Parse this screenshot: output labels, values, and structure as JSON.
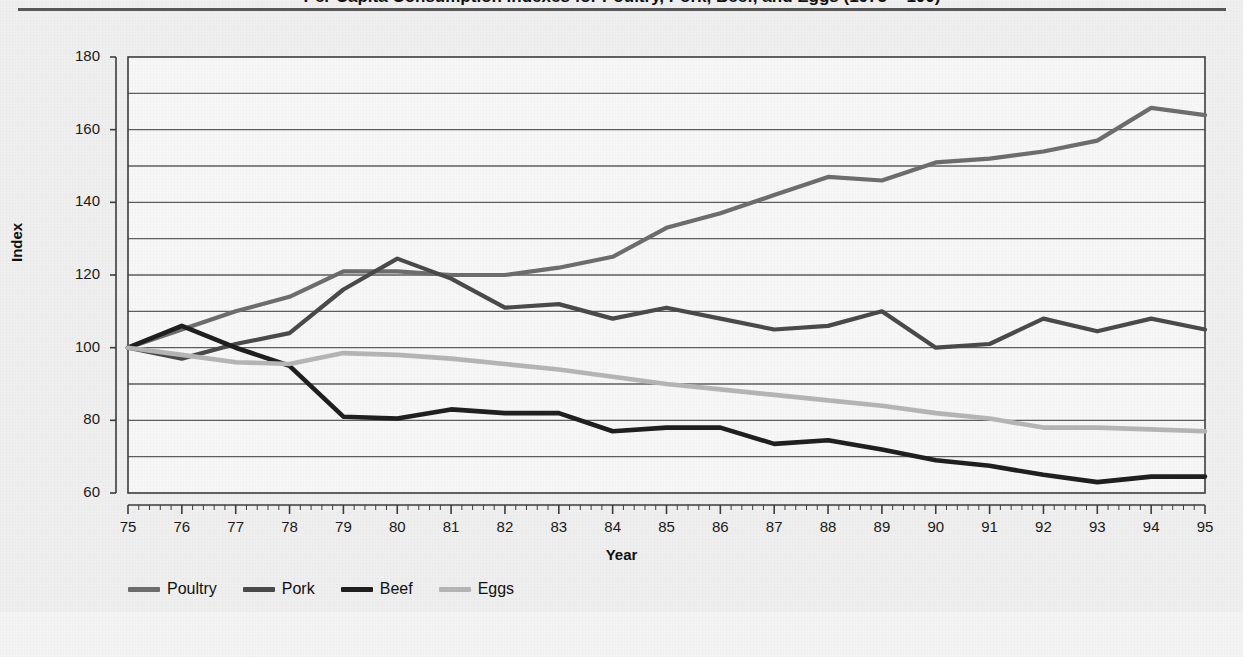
{
  "figure": {
    "title": "Per Capita Consumption Indexes for Poultry, Pork, Beef, and Eggs (1975 = 100)",
    "y_axis_title": "Index",
    "x_axis_title": "Year"
  },
  "colors": {
    "poultry": "#6d6d6d",
    "pork": "#4a4a4a",
    "beef": "#1f1f1f",
    "eggs": "#b5b5b5",
    "gridline": "#5e5e5e",
    "axis": "#3c3c3c",
    "plot_background": "#f7f7f7",
    "panel_background": "#efefef"
  },
  "legend": {
    "position": "bottom-left",
    "items": [
      {
        "label": "Poultry",
        "color": "#6d6d6d"
      },
      {
        "label": "Pork",
        "color": "#4a4a4a"
      },
      {
        "label": "Beef",
        "color": "#1f1f1f"
      },
      {
        "label": "Eggs",
        "color": "#b5b5b5"
      }
    ]
  },
  "chart_data": {
    "type": "line",
    "title": "Per Capita Consumption Indexes for Poultry, Pork, Beef, and Eggs (1975 = 100)",
    "xlabel": "Year",
    "ylabel": "Index",
    "xlim": [
      75,
      95
    ],
    "ylim": [
      60,
      180
    ],
    "y_major_ticks": [
      60,
      80,
      100,
      120,
      140,
      160,
      180
    ],
    "y_gridlines": [
      60,
      70,
      80,
      90,
      100,
      110,
      120,
      130,
      140,
      150,
      160,
      170,
      180
    ],
    "grid": "horizontal",
    "legend_position": "bottom-left",
    "x": [
      75,
      76,
      77,
      78,
      79,
      80,
      81,
      82,
      83,
      84,
      85,
      86,
      87,
      88,
      89,
      90,
      91,
      92,
      93,
      94,
      95
    ],
    "x_tick_labels": [
      "75",
      "76",
      "77",
      "78",
      "79",
      "80",
      "81",
      "82",
      "83",
      "84",
      "85",
      "86",
      "87",
      "88",
      "89",
      "90",
      "91",
      "92",
      "93",
      "94",
      "95"
    ],
    "series": [
      {
        "name": "Poultry",
        "color": "#6d6d6d",
        "values": [
          100,
          105,
          110,
          114,
          121,
          121,
          120,
          120,
          122,
          125,
          133,
          137,
          142,
          147,
          146,
          151,
          152,
          154,
          157,
          166,
          164
        ]
      },
      {
        "name": "Pork",
        "color": "#4a4a4a",
        "values": [
          100,
          97,
          101,
          104,
          116,
          124.5,
          119,
          111,
          112,
          108,
          111,
          108,
          105,
          106,
          110,
          100,
          101,
          108,
          104.5,
          108,
          105
        ]
      },
      {
        "name": "Beef",
        "color": "#1f1f1f",
        "values": [
          100,
          106,
          100,
          95,
          81,
          80.5,
          83,
          82,
          82,
          77,
          78,
          78,
          73.5,
          74.5,
          72,
          69,
          67.5,
          65,
          63,
          64.5,
          64.5
        ]
      },
      {
        "name": "Eggs",
        "color": "#b5b5b5",
        "values": [
          100,
          98,
          96,
          95.5,
          98.5,
          98,
          97,
          95.5,
          94,
          92,
          90,
          88.5,
          87,
          85.5,
          84,
          82,
          80.5,
          78,
          78,
          77.5,
          77
        ]
      }
    ]
  }
}
